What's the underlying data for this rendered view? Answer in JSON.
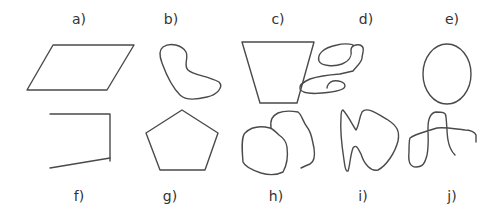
{
  "figure": {
    "stroke_color": "#4a4a4a",
    "text_color": "#333333",
    "background": "#ffffff",
    "shapes": [
      {
        "id": "a",
        "label": "a)",
        "kind": "parallelogram",
        "closed": true
      },
      {
        "id": "b",
        "label": "b)",
        "kind": "irregular-closed-curve",
        "closed": true
      },
      {
        "id": "c",
        "label": "c)",
        "kind": "trapezoid",
        "closed": true
      },
      {
        "id": "d",
        "label": "d)",
        "kind": "open-scribble-curve",
        "closed": false
      },
      {
        "id": "e",
        "label": "e)",
        "kind": "ellipse",
        "closed": true
      },
      {
        "id": "f",
        "label": "f)",
        "kind": "open-polyline",
        "closed": false
      },
      {
        "id": "g",
        "label": "g)",
        "kind": "pentagon",
        "closed": true
      },
      {
        "id": "h",
        "label": "h)",
        "kind": "open-overlapping-curve",
        "closed": false
      },
      {
        "id": "i",
        "label": "i)",
        "kind": "irregular-closed-curve",
        "closed": true
      },
      {
        "id": "j",
        "label": "j)",
        "kind": "open-self-crossing-curve",
        "closed": false
      }
    ]
  }
}
